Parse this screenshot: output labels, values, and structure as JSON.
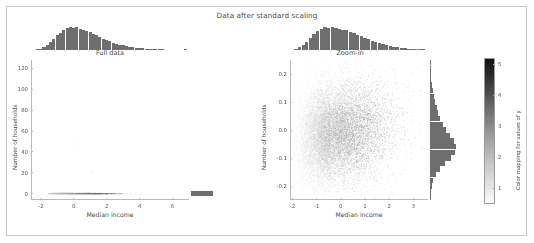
{
  "figure": {
    "suptitle": "Data after standard scaling",
    "background": "#ffffff",
    "frame_color": "#c8c8c8"
  },
  "panels": {
    "left": {
      "title": "Full data",
      "xlabel": "Median income",
      "ylabel": "Number of households",
      "xticks": [
        "-2",
        "0",
        "2",
        "4",
        "6"
      ],
      "xtick_values": [
        -2,
        0,
        2,
        4,
        6
      ],
      "yticks": [
        "0",
        "20",
        "40",
        "60",
        "80",
        "100",
        "120"
      ],
      "ytick_values": [
        0,
        20,
        40,
        60,
        80,
        100,
        120
      ],
      "xlim": [
        -2.6,
        7.0
      ],
      "ylim": [
        -6,
        128
      ]
    },
    "right": {
      "title": "Zoom-in",
      "xlabel": "Median income",
      "ylabel": "Number of households",
      "xticks": [
        "-2",
        "-1",
        "0",
        "1",
        "2",
        "3"
      ],
      "xtick_values": [
        -2,
        -1,
        0,
        1,
        2,
        3
      ],
      "yticks": [
        "0.2",
        "0.1",
        "0.0",
        "-0.1",
        "-0.2"
      ],
      "ytick_values": [
        0.2,
        0.1,
        0.0,
        -0.1,
        -0.2
      ],
      "xlim": [
        -2.1,
        3.6
      ],
      "ylim": [
        -0.25,
        0.25
      ]
    }
  },
  "colorbar": {
    "label": "Color mapping for values of y",
    "ticks": [
      "1",
      "2",
      "3",
      "4",
      "5"
    ],
    "tick_values": [
      1,
      2,
      3,
      4,
      5
    ],
    "vmin": 0.5,
    "vmax": 5.2,
    "cmap": "viridis-grayscale",
    "low_color": "#fefefe",
    "high_color": "#101010"
  },
  "chart_data": {
    "type": "scatter",
    "title": "Data after standard scaling",
    "xlabel": "Median income",
    "ylabel": "Number of households",
    "colorbar_label": "Color mapping for values of y",
    "panels": [
      {
        "name": "Full data",
        "xlim": [
          -2.6,
          7.0
        ],
        "ylim": [
          -6,
          128
        ],
        "xticks": [
          -2,
          0,
          2,
          4,
          6
        ],
        "yticks": [
          0,
          20,
          40,
          60,
          80,
          100,
          120
        ],
        "description": "Standard-scaled median income vs number of households; nearly all mass compressed at y near 0 with a few extreme outliers up to ~120.",
        "marginal_x_hist": {
          "orientation": "vertical",
          "bin_centers": [
            -2.4,
            -2.2,
            -2.0,
            -1.8,
            -1.6,
            -1.4,
            -1.2,
            -1.0,
            -0.8,
            -0.6,
            -0.4,
            -0.2,
            0.0,
            0.2,
            0.4,
            0.6,
            0.8,
            1.0,
            1.2,
            1.4,
            1.6,
            1.8,
            2.0,
            2.2,
            2.4,
            2.6,
            2.8,
            3.0,
            3.2,
            3.4,
            3.6,
            3.8,
            4.0,
            4.2,
            4.4,
            4.6,
            4.8,
            5.0,
            5.2,
            5.4,
            5.6,
            5.8,
            6.0,
            6.2,
            6.4,
            6.6,
            6.8
          ],
          "counts": [
            2,
            5,
            12,
            26,
            46,
            72,
            100,
            128,
            152,
            176,
            190,
            198,
            192,
            200,
            186,
            178,
            168,
            156,
            142,
            128,
            114,
            100,
            88,
            76,
            65,
            55,
            47,
            40,
            34,
            28,
            24,
            20,
            17,
            14,
            12,
            10,
            8,
            7,
            6,
            5,
            4,
            4,
            3,
            3,
            2,
            2,
            12
          ]
        },
        "marginal_y_hist": {
          "orientation": "horizontal",
          "bin_centers": [
            0,
            5,
            10,
            15,
            20,
            25,
            30,
            35,
            40,
            45,
            50,
            55,
            60,
            65,
            70,
            75,
            80,
            85,
            90,
            95,
            100,
            105,
            110,
            115,
            120
          ],
          "counts": [
            400,
            1,
            0,
            0,
            0,
            0,
            0,
            0,
            0,
            0,
            0,
            0,
            0,
            0,
            0,
            0,
            0,
            0,
            0,
            0,
            0,
            0,
            0,
            0,
            1
          ]
        },
        "outlier_points": [
          {
            "x": 0.2,
            "y": 48
          },
          {
            "x": 1.1,
            "y": 22
          }
        ]
      },
      {
        "name": "Zoom-in",
        "xlim": [
          -2.1,
          3.6
        ],
        "ylim": [
          -0.25,
          0.25
        ],
        "xticks": [
          -2,
          -1,
          0,
          1,
          2,
          3
        ],
        "yticks": [
          -0.2,
          -0.1,
          0.0,
          0.1,
          0.2
        ],
        "n_points": 18000,
        "description": "Dense point cloud centered near x=-0.4, y=-0.02; color encodes y-value of target, darker toward higher income.",
        "cluster_center": [
          -0.45,
          -0.015
        ],
        "cluster_spread": [
          0.95,
          0.085
        ],
        "marginal_x_hist": {
          "orientation": "vertical",
          "bin_centers": [
            -2.0,
            -1.85,
            -1.7,
            -1.55,
            -1.4,
            -1.25,
            -1.1,
            -0.95,
            -0.8,
            -0.65,
            -0.5,
            -0.35,
            -0.2,
            -0.05,
            0.1,
            0.25,
            0.4,
            0.55,
            0.7,
            0.85,
            1.0,
            1.15,
            1.3,
            1.45,
            1.6,
            1.75,
            1.9,
            2.05,
            2.2,
            2.35,
            2.5,
            2.65,
            2.8,
            2.95,
            3.1,
            3.25,
            3.4,
            3.55
          ],
          "counts": [
            4,
            10,
            22,
            42,
            70,
            104,
            136,
            164,
            182,
            196,
            188,
            200,
            192,
            184,
            178,
            170,
            158,
            146,
            132,
            118,
            104,
            92,
            80,
            68,
            58,
            49,
            41,
            34,
            28,
            23,
            19,
            15,
            12,
            10,
            8,
            6,
            5,
            4
          ]
        },
        "marginal_y_hist": {
          "orientation": "horizontal",
          "bin_centers": [
            -0.24,
            -0.22,
            -0.2,
            -0.18,
            -0.16,
            -0.14,
            -0.12,
            -0.1,
            -0.08,
            -0.06,
            -0.04,
            -0.02,
            0.0,
            0.02,
            0.04,
            0.06,
            0.08,
            0.1,
            0.12,
            0.14,
            0.16,
            0.18,
            0.2,
            0.22,
            0.24
          ],
          "counts": [
            3,
            6,
            12,
            24,
            44,
            76,
            118,
            162,
            196,
            200,
            182,
            152,
            124,
            100,
            80,
            64,
            50,
            38,
            28,
            20,
            14,
            9,
            6,
            4,
            2
          ]
        }
      }
    ]
  }
}
